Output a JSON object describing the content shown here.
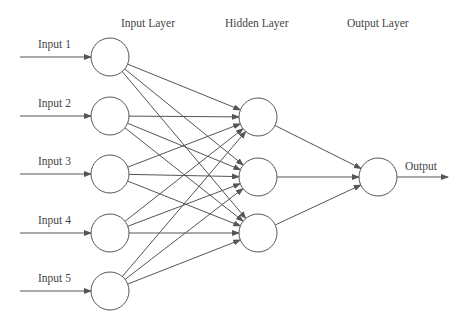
{
  "diagram": {
    "layers": {
      "input": {
        "title": "Input Layer",
        "nodes": [
          "Input 1",
          "Input 2",
          "Input 3",
          "Input 4",
          "Input 5"
        ]
      },
      "hidden": {
        "title": "Hidden Layer",
        "node_count": 3
      },
      "output": {
        "title": "Output Layer",
        "label": "Output"
      }
    },
    "colors": {
      "stroke": "#555555",
      "text": "#444444",
      "background": "#ffffff"
    }
  }
}
